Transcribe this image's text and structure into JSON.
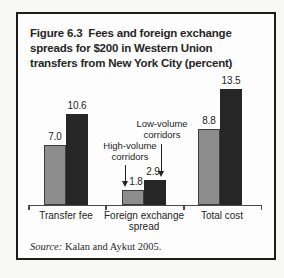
{
  "figure": {
    "title": "Figure 6.3  Fees and foreign exchange\nspreads for $200 in Western Union\ntransfers from New York City (percent)",
    "source_label": "Source:",
    "source_text": " Kalan and Aykut 2005."
  },
  "chart_data": {
    "type": "bar",
    "title": "Figure 6.3 Fees and foreign exchange spreads for $200 in Western Union transfers from New York City (percent)",
    "unit": "percent",
    "categories": [
      "Transfer fee",
      "Foreign exchange spread",
      "Total cost"
    ],
    "series": [
      {
        "name": "High-volume corridors",
        "color": "#8d8d8d",
        "values": [
          7.0,
          1.8,
          8.8
        ],
        "labels": [
          "7.0",
          "1.8",
          "8.8"
        ]
      },
      {
        "name": "Low-volume corridors",
        "color": "#262626",
        "values": [
          10.6,
          2.9,
          13.5
        ],
        "labels": [
          "10.6",
          "2.9",
          "13.5"
        ]
      }
    ],
    "annotations": [
      {
        "text": "High-volume\ncorridors",
        "points_to_series": "High-volume corridors",
        "points_to_category": "Foreign exchange spread"
      },
      {
        "text": "Low-volume\ncorridors",
        "points_to_series": "Low-volume corridors",
        "points_to_category": "Foreign exchange spread"
      }
    ],
    "ylim": [
      0,
      14
    ],
    "grid": false,
    "axis_visible": "x-only",
    "legend_position": "inline-annotations"
  }
}
